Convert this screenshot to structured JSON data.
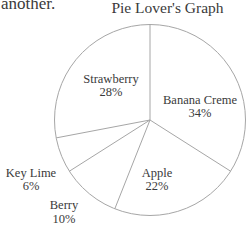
{
  "page": {
    "background": "#ffffff",
    "corner_text": "another."
  },
  "chart_data": {
    "type": "pie",
    "title": "Pie Lover's Graph",
    "direction": "clockwise",
    "start_angle_deg": 0,
    "unit": "%",
    "categories": [
      "Banana Creme",
      "Apple",
      "Berry",
      "Key Lime",
      "Strawberry"
    ],
    "values": [
      34,
      22,
      10,
      6,
      28
    ],
    "slices": [
      {
        "label": "Banana Creme",
        "value": 34,
        "pct_label": "34%",
        "label_placement": "inside"
      },
      {
        "label": "Apple",
        "value": 22,
        "pct_label": "22%",
        "label_placement": "inside"
      },
      {
        "label": "Berry",
        "value": 10,
        "pct_label": "10%",
        "label_placement": "outside"
      },
      {
        "label": "Key Lime",
        "value": 6,
        "pct_label": "6%",
        "label_placement": "outside"
      },
      {
        "label": "Strawberry",
        "value": 28,
        "pct_label": "28%",
        "label_placement": "inside"
      }
    ],
    "colors": {
      "line": "#a6a6a6",
      "text": "#3a3a3a",
      "background": "#ffffff"
    }
  }
}
